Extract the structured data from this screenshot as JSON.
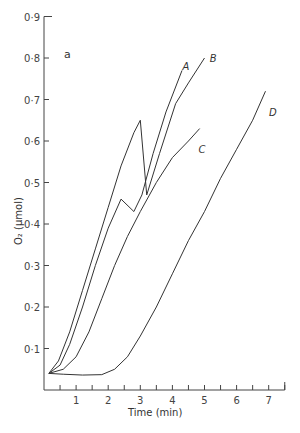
{
  "chart_data": {
    "type": "line",
    "title": "",
    "panel_label": "a",
    "xlabel": "Time (min)",
    "ylabel": "O₂ (μmol)",
    "xlim": [
      0,
      7.5
    ],
    "ylim": [
      0,
      0.9
    ],
    "grid": false,
    "x_ticks": [
      1,
      2,
      3,
      4,
      5,
      6,
      7
    ],
    "x_minor_ticks": [
      0.5,
      1.5,
      2.5,
      3.5,
      4.5,
      5.5,
      6.5,
      7.5
    ],
    "y_ticks": [
      0.1,
      0.2,
      0.3,
      0.4,
      0.5,
      0.6,
      0.7,
      0.8,
      0.9
    ],
    "y_tick_labels": [
      "0·1",
      "0·2",
      "0·3",
      "0·4",
      "0·5",
      "0·6",
      "0·7",
      "0·8",
      "0·9"
    ],
    "series": [
      {
        "name": "A",
        "label_pos": [
          4.25,
          0.78
        ],
        "points": [
          [
            0.15,
            0.04
          ],
          [
            0.5,
            0.06
          ],
          [
            0.8,
            0.11
          ],
          [
            1.2,
            0.2
          ],
          [
            1.6,
            0.3
          ],
          [
            2.0,
            0.39
          ],
          [
            2.4,
            0.46
          ],
          [
            2.8,
            0.43
          ],
          [
            3.05,
            0.47
          ],
          [
            3.4,
            0.57
          ],
          [
            3.8,
            0.67
          ],
          [
            4.3,
            0.77
          ]
        ]
      },
      {
        "name": "B",
        "label_pos": [
          5.1,
          0.8
        ],
        "points": [
          [
            0.15,
            0.04
          ],
          [
            0.45,
            0.07
          ],
          [
            0.8,
            0.14
          ],
          [
            1.2,
            0.24
          ],
          [
            1.6,
            0.34
          ],
          [
            2.0,
            0.44
          ],
          [
            2.4,
            0.54
          ],
          [
            2.8,
            0.62
          ],
          [
            3.0,
            0.65
          ],
          [
            3.2,
            0.47
          ],
          [
            3.6,
            0.57
          ],
          [
            4.1,
            0.69
          ],
          [
            4.5,
            0.74
          ],
          [
            5.0,
            0.8
          ]
        ]
      },
      {
        "name": "C",
        "label_pos": [
          4.75,
          0.58
        ],
        "points": [
          [
            0.15,
            0.04
          ],
          [
            0.6,
            0.05
          ],
          [
            1.0,
            0.08
          ],
          [
            1.4,
            0.14
          ],
          [
            1.8,
            0.22
          ],
          [
            2.2,
            0.3
          ],
          [
            2.6,
            0.37
          ],
          [
            3.0,
            0.43
          ],
          [
            3.5,
            0.5
          ],
          [
            4.0,
            0.56
          ],
          [
            4.5,
            0.6
          ],
          [
            4.85,
            0.63
          ]
        ]
      },
      {
        "name": "D",
        "label_pos": [
          6.95,
          0.67
        ],
        "points": [
          [
            0.15,
            0.04
          ],
          [
            0.6,
            0.038
          ],
          [
            1.2,
            0.036
          ],
          [
            1.8,
            0.037
          ],
          [
            2.2,
            0.05
          ],
          [
            2.6,
            0.08
          ],
          [
            3.0,
            0.13
          ],
          [
            3.5,
            0.2
          ],
          [
            4.0,
            0.28
          ],
          [
            4.5,
            0.36
          ],
          [
            5.0,
            0.43
          ],
          [
            5.5,
            0.51
          ],
          [
            6.0,
            0.58
          ],
          [
            6.5,
            0.65
          ],
          [
            6.9,
            0.72
          ]
        ]
      }
    ]
  },
  "layout": {
    "origin_px": [
      44,
      390
    ],
    "px_per_x": 32.1,
    "px_per_y": 415
  }
}
